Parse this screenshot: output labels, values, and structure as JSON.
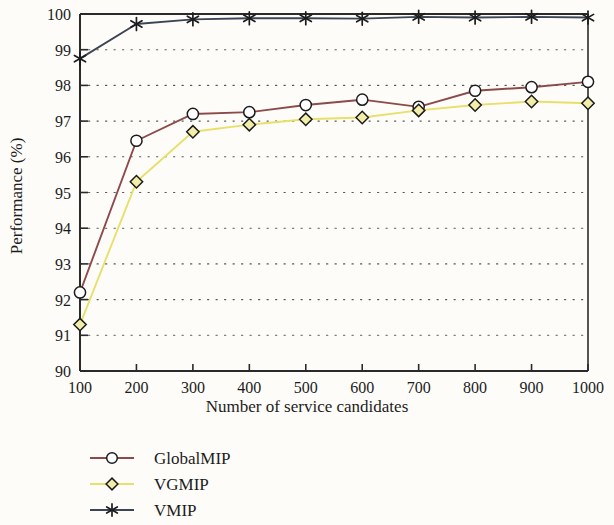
{
  "chart_data": {
    "type": "line",
    "title": "",
    "xlabel": "Number of service candidates",
    "ylabel": "Performance (%)",
    "x": [
      100,
      200,
      300,
      400,
      500,
      600,
      700,
      800,
      900,
      1000
    ],
    "xticklabels": [
      "100",
      "200",
      "300",
      "400",
      "500",
      "600",
      "700",
      "800",
      "900",
      "1000"
    ],
    "yticklabels": [
      "90",
      "91",
      "92",
      "93",
      "94",
      "95",
      "96",
      "97",
      "98",
      "99",
      "100"
    ],
    "xlim": [
      100,
      1000
    ],
    "ylim": [
      90,
      100
    ],
    "ytick_step": 1,
    "grid": "horizontal-dotted",
    "legend_position": "below-left",
    "series": [
      {
        "name": "GlobalMIP",
        "color": "#8c4a4a",
        "marker": "circle",
        "values": [
          92.2,
          96.45,
          97.2,
          97.25,
          97.45,
          97.6,
          97.4,
          97.85,
          97.95,
          98.1
        ]
      },
      {
        "name": "VGMIP",
        "color": "#e8e06a",
        "marker": "diamond",
        "values": [
          91.3,
          95.3,
          96.7,
          96.9,
          97.05,
          97.1,
          97.3,
          97.45,
          97.55,
          97.5
        ]
      },
      {
        "name": "VMIP",
        "color": "#3c4556",
        "marker": "asterisk",
        "values": [
          98.75,
          99.72,
          99.85,
          99.88,
          99.88,
          99.87,
          99.92,
          99.9,
          99.92,
          99.9
        ]
      }
    ]
  },
  "legend": {
    "items": [
      {
        "label": "GlobalMIP"
      },
      {
        "label": "VGMIP"
      },
      {
        "label": "VMIP"
      }
    ]
  },
  "axes": {
    "x_title": "Number of service candidates",
    "y_title": "Performance (%)"
  }
}
